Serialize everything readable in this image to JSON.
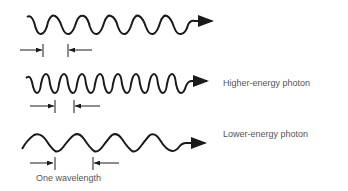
{
  "diagram": {
    "waves": [
      {
        "id": "reference-wave",
        "label": "",
        "wavelength_px": 19,
        "amplitude_px": 9,
        "x_start": 27,
        "x_end": 200,
        "y_center": 25
      },
      {
        "id": "higher-energy-wave",
        "label": "Higher-energy photon",
        "wavelength_px": 15.5,
        "amplitude_px": 9,
        "x_start": 27,
        "x_end": 190,
        "y_center": 84
      },
      {
        "id": "lower-energy-wave",
        "label": "Lower-energy photon",
        "wavelength_px": 38,
        "amplitude_px": 8,
        "x_start": 22,
        "x_end": 175,
        "y_center": 145
      }
    ],
    "wavelength_caption": "One wavelength",
    "colors": {
      "stroke": "#1a1a1a",
      "text": "#555555"
    }
  }
}
